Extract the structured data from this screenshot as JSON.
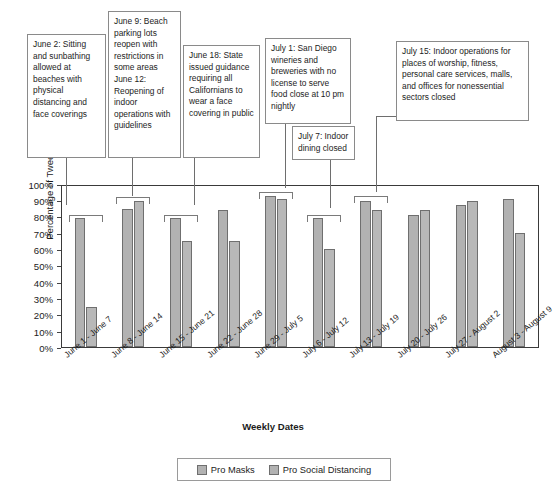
{
  "chart_data": {
    "type": "bar",
    "title": "",
    "xlabel": "Weekly Dates",
    "ylabel": "Percentage of Tweets",
    "ylim": [
      0,
      100
    ],
    "ytick_labels": [
      "0%",
      "10%",
      "20%",
      "30%",
      "40%",
      "50%",
      "60%",
      "70%",
      "80%",
      "90%",
      "100%"
    ],
    "ytick_values": [
      0,
      10,
      20,
      30,
      40,
      50,
      60,
      70,
      80,
      90,
      100
    ],
    "grid": false,
    "legend_position": "bottom-center",
    "categories": [
      "June 1 - June 7",
      "June 8 - June 14",
      "June 15 - June 21",
      "June 22 - June 28",
      "June 29 - July 5",
      "July 6 - July 12",
      "July 13 - July 19",
      "July 20 - July 26",
      "July 27 - August 2",
      "August 3 - August 9"
    ],
    "series": [
      {
        "name": "Pro Masks",
        "color": "#b2b2b2",
        "values": [
          80,
          86,
          80,
          85,
          94,
          80,
          91,
          82,
          88,
          92
        ]
      },
      {
        "name": "Pro Social Distancing",
        "color": "#b8b8b8",
        "values": [
          25,
          91,
          66,
          66,
          92,
          61,
          85,
          85,
          91,
          71
        ]
      }
    ],
    "annotations": [
      {
        "id": "june-2",
        "text": "June 2: Sitting and sunbathing allowed at beaches with physical distancing and face coverings",
        "points_to_category": "June 1 - June 7"
      },
      {
        "id": "june-9-12",
        "text": "June 9: Beach parking lots reopen with restrictions in some areas June 12: Reopening of indoor operations with guidelines",
        "points_to_category": "June 8 - June 14"
      },
      {
        "id": "june-18",
        "text": "June 18: State issued guidance requiring all Californians to wear a face covering in public",
        "points_to_category": "June 15 - June 21"
      },
      {
        "id": "july-1",
        "text": "July 1: San Diego wineries and breweries with no license to serve food close at 10 pm nightly",
        "points_to_category": "June 29 - July 5"
      },
      {
        "id": "july-7",
        "text": "July 7: Indoor dining closed",
        "points_to_category": "July 6 - July 12"
      },
      {
        "id": "july-15",
        "text": "July 15: Indoor operations for places of worship, fitness, personal care services, malls, and offices for nonessential sectors closed",
        "points_to_category": "July 13 - July 19"
      }
    ]
  },
  "legend": {
    "items": [
      {
        "label": "Pro Masks"
      },
      {
        "label": "Pro Social Distancing"
      }
    ]
  }
}
